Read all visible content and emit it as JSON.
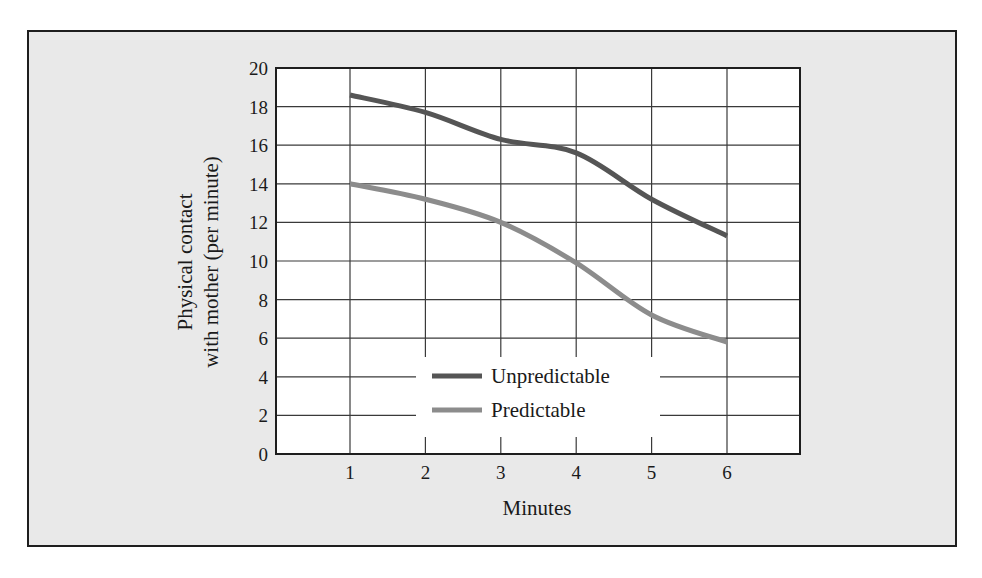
{
  "chart_data": {
    "type": "line",
    "title": "",
    "xlabel": "Minutes",
    "ylabel": "Physical contact with mother (per minute)",
    "ylabel_lines": [
      "Physical contact",
      "with mother (per minute)"
    ],
    "x": [
      1,
      2,
      3,
      4,
      5,
      6
    ],
    "x_ticks": [
      "1",
      "2",
      "3",
      "4",
      "5",
      "6"
    ],
    "y_ticks": [
      "0",
      "2",
      "4",
      "6",
      "8",
      "10",
      "12",
      "14",
      "16",
      "18",
      "20"
    ],
    "xlim": [
      0,
      7
    ],
    "ylim": [
      0,
      20
    ],
    "grid": true,
    "legend_position": "lower center (inside plot)",
    "series": [
      {
        "name": "Unpredictable",
        "color": "#555555",
        "values": [
          18.6,
          17.7,
          16.3,
          15.6,
          13.2,
          11.3
        ]
      },
      {
        "name": "Predictable",
        "color": "#8c8c8c",
        "values": [
          14.0,
          13.2,
          12.0,
          9.9,
          7.2,
          5.8
        ]
      }
    ]
  },
  "legend": {
    "items": [
      {
        "label": "Unpredictable",
        "color": "#555555"
      },
      {
        "label": "Predictable",
        "color": "#8c8c8c"
      }
    ]
  },
  "colors": {
    "frame_background": "#e9e9e9",
    "plot_background": "#ffffff",
    "frame_border": "#1e1e1e",
    "grid": "#3a3a3a"
  }
}
